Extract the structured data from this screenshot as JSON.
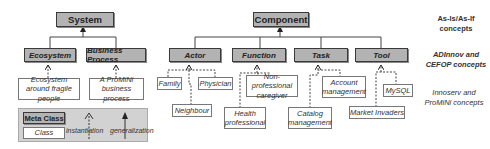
{
  "meta_classes": {
    "system": "System",
    "component": "Component",
    "ecosystem": "Ecosystem",
    "business_process": "Business Process",
    "actor": "Actor",
    "function": "Function",
    "task": "Task",
    "tool": "Tool"
  },
  "classes": {
    "ecosystem_fragile": "Ecosystem around fragile people",
    "promini_bp": "A ProMiNi business process",
    "family": "Family",
    "physician": "Physician",
    "neighbour": "Neighbour",
    "non_prof_caregiver": "Non-professional caregiver",
    "health_prof": "Health professional",
    "account_mgmt": "Account management",
    "catalog_mgmt": "Catalog management",
    "mysql": "MySQL",
    "market_invaders": "Market Invaders"
  },
  "legend": {
    "meta_class": "Meta Class",
    "class": "Class",
    "instantiation": "instantiation",
    "generalization": "generalization"
  },
  "levels": {
    "as_is": "As-Is/As-If concepts",
    "adinnov": "ADInnov and CEFOP concepts",
    "innoserv": "Innoserv and ProMiNi concepts"
  },
  "colors": {
    "meta_fill": "#b3b3b3",
    "meta_border": "#3a3a3a",
    "legend_fill": "#d2d2d2"
  }
}
